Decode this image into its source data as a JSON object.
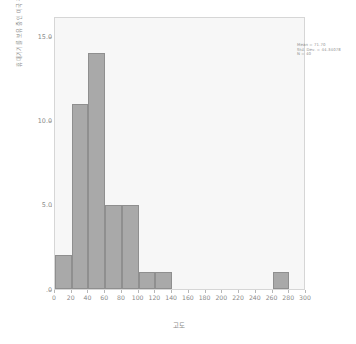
{
  "chart_data": {
    "type": "bar",
    "title": "",
    "subtitle": "",
    "xlabel": "고도",
    "ylabel": "휴대기기를 보유 중인 미국 청소년 수",
    "xlim": [
      0,
      300
    ],
    "ylim": [
      0,
      16.2
    ],
    "bin_width": 20,
    "grid": false,
    "legend": null,
    "categories": [
      "0-20",
      "20-40",
      "40-60",
      "60-80",
      "80-100",
      "100-120",
      "120-140",
      "140-160",
      "160-180",
      "180-200",
      "200-220",
      "220-240",
      "240-260",
      "260-280",
      "280-300"
    ],
    "bin_starts": [
      0,
      20,
      40,
      60,
      80,
      100,
      120,
      140,
      160,
      180,
      200,
      220,
      240,
      260,
      280
    ],
    "values": [
      2,
      11,
      14,
      5,
      5,
      1,
      1,
      0,
      0,
      0,
      0,
      0,
      0,
      1,
      0
    ],
    "x_ticks": [
      0,
      20,
      40,
      60,
      80,
      100,
      120,
      140,
      160,
      180,
      200,
      220,
      240,
      260,
      280,
      300
    ],
    "x_tick_labels": [
      "0",
      "20",
      "40",
      "60",
      "80",
      "100",
      "120",
      "140",
      "160",
      "180",
      "200",
      "220",
      "240",
      "260",
      "280",
      "300"
    ],
    "y_ticks": [
      0,
      5,
      10,
      15
    ],
    "y_tick_labels": [
      ".0",
      "5.0",
      "10.0",
      "15.0"
    ],
    "bar_color": "#a9a9a9",
    "bar_border_color": "#8f8f8f",
    "plot_background": "#f7f7f7",
    "plot_border_color": "#d6d6d6",
    "text_color": "#8a8a8a"
  },
  "annotation": {
    "mean_label": "Mean = 71.70",
    "std_dev_label": "Std. Dev. = 44.34078",
    "n_label": "N = 40"
  }
}
